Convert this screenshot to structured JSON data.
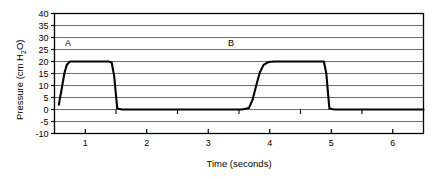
{
  "chart_data": {
    "type": "line",
    "title": "",
    "subtitle": "",
    "xlabel": "Time (seconds)",
    "ylabel": "Pressure (cm H₂O)",
    "ylabel_parts": {
      "main": "Pressure (cm H",
      "sub": "2",
      "tail": "O)"
    },
    "xlim": [
      0.5,
      6.5
    ],
    "ylim": [
      -10,
      40
    ],
    "grid": true,
    "grid_axis": "y",
    "legend": "none",
    "x_ticks": [
      1,
      2,
      3,
      4,
      5,
      6
    ],
    "x_tick_labels": [
      "1",
      "2",
      "3",
      "4",
      "5",
      "6"
    ],
    "x_minor_ticks": [
      1.5,
      2.5,
      3.5,
      4.5,
      5.5,
      6.5
    ],
    "y_ticks": [
      -10,
      -5,
      0,
      5,
      10,
      15,
      20,
      25,
      30,
      35,
      40
    ],
    "y_tick_labels": [
      "-10",
      "-5",
      "0",
      "5",
      "10",
      "15",
      "20",
      "25",
      "30",
      "35",
      "40"
    ],
    "baseline_value": 0,
    "plateau_value": 20,
    "series": [
      {
        "name": "airway pressure",
        "color": "#000000",
        "points": [
          [
            0.57,
            2.0
          ],
          [
            0.62,
            9.0
          ],
          [
            0.66,
            15.0
          ],
          [
            0.7,
            18.6
          ],
          [
            0.75,
            20.0
          ],
          [
            0.85,
            20.0
          ],
          [
            1.1,
            20.0
          ],
          [
            1.38,
            20.0
          ],
          [
            1.43,
            19.6
          ],
          [
            1.47,
            14.0
          ],
          [
            1.5,
            6.0
          ],
          [
            1.52,
            0.4
          ],
          [
            1.6,
            0.0
          ],
          [
            2.3,
            0.0
          ],
          [
            3.0,
            0.0
          ],
          [
            3.55,
            0.0
          ],
          [
            3.66,
            0.6
          ],
          [
            3.72,
            4.0
          ],
          [
            3.78,
            10.0
          ],
          [
            3.84,
            15.5
          ],
          [
            3.9,
            18.6
          ],
          [
            3.98,
            19.8
          ],
          [
            4.08,
            20.0
          ],
          [
            4.4,
            20.0
          ],
          [
            4.8,
            20.0
          ],
          [
            4.88,
            20.0
          ],
          [
            4.92,
            15.0
          ],
          [
            4.95,
            6.0
          ],
          [
            4.97,
            0.4
          ],
          [
            5.05,
            0.0
          ],
          [
            5.6,
            0.0
          ],
          [
            6.2,
            0.0
          ],
          [
            6.5,
            0.0
          ]
        ]
      }
    ],
    "annotations": [
      {
        "text": "A",
        "x": 0.72,
        "y": 26.5,
        "name": "annotation-a"
      },
      {
        "text": "B",
        "x": 3.37,
        "y": 26.5,
        "name": "annotation-b"
      }
    ]
  },
  "colors": {
    "frame": "#000000",
    "gridline": "#6e6e6e",
    "trace": "#000000",
    "background": "#ffffff"
  }
}
